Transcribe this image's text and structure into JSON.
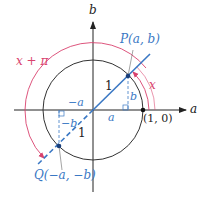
{
  "diagram": {
    "axes": {
      "horizontal_label": "a",
      "vertical_label": "b"
    },
    "points": {
      "P": {
        "label": "P(a, b)"
      },
      "Q": {
        "label": "Q(−a, −b)"
      },
      "unit_point": {
        "label": "(1, 0)"
      }
    },
    "angles": {
      "inner": {
        "label": "x"
      },
      "outer": {
        "label": "x + π"
      }
    },
    "segment_labels": {
      "radius_P": "1",
      "radius_Q": "1",
      "a": "a",
      "b": "b",
      "neg_a": "−a",
      "neg_b": "−b"
    },
    "colors": {
      "axis": "#222222",
      "circle": "#333333",
      "line": "#3a78c4",
      "arc": "#d9426e",
      "label_blue": "#3a78c4",
      "label_pink": "#d9426e"
    }
  }
}
